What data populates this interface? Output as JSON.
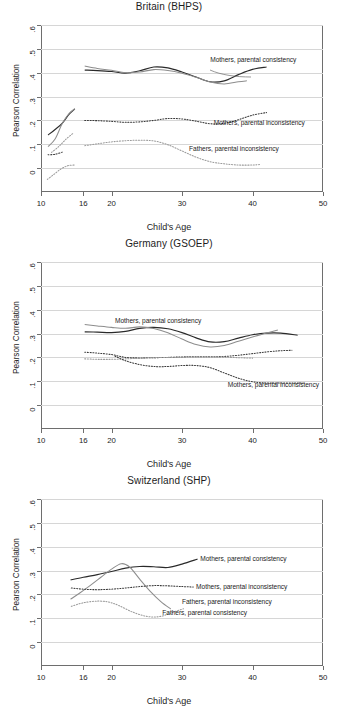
{
  "figure": {
    "width": 338,
    "height": 711,
    "background": "#ffffff",
    "axis_color": "#6e6e6e",
    "grid_color": "#d6d6d6"
  },
  "shared": {
    "xlabel": "Child's Age",
    "ylabel": "Pearson Correlation",
    "xticks": [
      10,
      16,
      20,
      30,
      40,
      50
    ],
    "xtick_labels": [
      "10",
      "16",
      "20",
      "30",
      "40",
      "50"
    ],
    "yticks": [
      0,
      0.1,
      0.2,
      0.3,
      0.4,
      0.5,
      0.6
    ],
    "ytick_labels": [
      "0",
      ".1",
      ".2",
      ".3",
      ".4",
      ".5",
      ".6"
    ],
    "xlim": [
      10,
      50
    ],
    "ylim": [
      -0.1,
      0.6
    ],
    "grid": "horizontal"
  },
  "chart_data": [
    {
      "type": "line",
      "title": "Britain (BHPS)",
      "xlabel": "Child's Age",
      "ylabel": "Pearson Correlation",
      "xlim": [
        10,
        50
      ],
      "ylim": [
        -0.1,
        0.6
      ],
      "xticks": [
        10,
        16,
        20,
        30,
        40,
        50
      ],
      "yticks": [
        0,
        0.1,
        0.2,
        0.3,
        0.4,
        0.5,
        0.6
      ],
      "grid": "horizontal",
      "legend_position": "inline-annotations",
      "annotations": [
        {
          "text": "Mothers, parental consistency",
          "x": 34.0,
          "y": 0.452
        },
        {
          "text": "Mothers, parental inconsistency",
          "x": 34.5,
          "y": 0.19
        },
        {
          "text": "Fathers, parental inconsistency",
          "x": 31.0,
          "y": 0.082
        }
      ],
      "series": [
        {
          "name": "Mothers, parental consistency (sample A)",
          "style": "solid-dark",
          "x": [
            16.2,
            18,
            20,
            22,
            24,
            26,
            28,
            30,
            32,
            34,
            36,
            38,
            40,
            42
          ],
          "y": [
            0.411,
            0.409,
            0.405,
            0.398,
            0.408,
            0.424,
            0.42,
            0.403,
            0.382,
            0.362,
            0.366,
            0.392,
            0.414,
            0.424
          ]
        },
        {
          "name": "Mothers, parental consistency (sample B)",
          "style": "solid-grey",
          "x": [
            16.2,
            18,
            20,
            22,
            24,
            26,
            28,
            30,
            32,
            34,
            36,
            38,
            39.2
          ],
          "y": [
            0.428,
            0.418,
            0.41,
            0.4,
            0.403,
            0.413,
            0.409,
            0.398,
            0.381,
            0.361,
            0.353,
            0.362,
            0.366
          ]
        },
        {
          "name": "Mothers, parental consistency (early adolescence, dark)",
          "style": "solid-dark",
          "x": [
            11.0,
            12.0,
            13.0,
            14.0,
            14.8
          ],
          "y": [
            0.139,
            0.162,
            0.188,
            0.226,
            0.248
          ]
        },
        {
          "name": "Mothers, parental consistency (early adolescence, grey)",
          "style": "solid-grey",
          "x": [
            11.0,
            12.0,
            13.0,
            14.0,
            14.8
          ],
          "y": [
            0.09,
            0.122,
            0.186,
            0.23,
            0.249
          ]
        },
        {
          "name": "Mothers, parental inconsistency",
          "style": "dot-dark",
          "x": [
            16.2,
            18,
            20,
            22,
            24,
            26,
            28,
            30,
            32,
            34,
            36,
            38,
            40,
            42
          ],
          "y": [
            0.2,
            0.199,
            0.196,
            0.192,
            0.194,
            0.2,
            0.208,
            0.206,
            0.197,
            0.186,
            0.188,
            0.203,
            0.222,
            0.233
          ]
        },
        {
          "name": "Mothers, parental inconsistency (early adolescence)",
          "style": "dot-dark",
          "x": [
            11.0,
            12.0,
            13.0
          ],
          "y": [
            0.056,
            0.058,
            0.067
          ]
        },
        {
          "name": "Fathers, parental inconsistency",
          "style": "dot-grey",
          "x": [
            16.2,
            18,
            20,
            22,
            24,
            26,
            28,
            30,
            32,
            34,
            36,
            38,
            40,
            41
          ],
          "y": [
            0.094,
            0.102,
            0.11,
            0.115,
            0.117,
            0.114,
            0.098,
            0.072,
            0.046,
            0.027,
            0.018,
            0.013,
            0.013,
            0.015
          ]
        },
        {
          "name": "Fathers, parental inconsistency (early adolescence)",
          "style": "dot-grey",
          "x": [
            11.5,
            12.5,
            13.5,
            14.6
          ],
          "y": [
            0.066,
            0.09,
            0.12,
            0.147
          ]
        },
        {
          "name": "Fathers, parental consistency (early adolescence)",
          "style": "dot-grey",
          "x": [
            10.9,
            11.8,
            12.8,
            13.8,
            14.8
          ],
          "y": [
            -0.047,
            -0.027,
            -0.004,
            0.01,
            0.013
          ]
        }
      ]
    },
    {
      "type": "line",
      "title": "Germany (GSOEP)",
      "xlabel": "Child's Age",
      "ylabel": "Pearson Correlation",
      "xlim": [
        10,
        50
      ],
      "ylim": [
        -0.1,
        0.6
      ],
      "xticks": [
        10,
        16,
        20,
        30,
        40,
        50
      ],
      "yticks": [
        0,
        0.1,
        0.2,
        0.3,
        0.4,
        0.5,
        0.6
      ],
      "grid": "horizontal",
      "legend_position": "inline-annotations",
      "annotations": [
        {
          "text": "Mothers, parental consistency",
          "x": 20.5,
          "y": 0.352
        },
        {
          "text": "Mothers, parental inconsistency",
          "x": 36.5,
          "y": 0.086
        }
      ],
      "series": [
        {
          "name": "Mothers, parental consistency (sample A)",
          "style": "solid-dark",
          "x": [
            16.2,
            18,
            20,
            22,
            24,
            26,
            28,
            30,
            32,
            34,
            36,
            38,
            40,
            42,
            44,
            46.4
          ],
          "y": [
            0.307,
            0.306,
            0.304,
            0.309,
            0.322,
            0.326,
            0.32,
            0.304,
            0.282,
            0.265,
            0.266,
            0.281,
            0.295,
            0.302,
            0.302,
            0.293
          ]
        },
        {
          "name": "Mothers, parental consistency (sample B)",
          "style": "solid-grey",
          "x": [
            16.2,
            18,
            20,
            22,
            24,
            26,
            28,
            30,
            32,
            34,
            36,
            38,
            40,
            42,
            43.6
          ],
          "y": [
            0.338,
            0.332,
            0.326,
            0.322,
            0.328,
            0.321,
            0.303,
            0.277,
            0.254,
            0.244,
            0.25,
            0.268,
            0.286,
            0.302,
            0.315
          ]
        },
        {
          "name": "Mothers, parental inconsistency (upper)",
          "style": "dot-dark",
          "x": [
            16.2,
            18,
            20,
            22,
            24,
            26,
            28,
            30,
            32,
            34,
            36,
            38,
            40,
            42,
            44,
            45.6
          ],
          "y": [
            0.222,
            0.218,
            0.212,
            0.2,
            0.198,
            0.199,
            0.2,
            0.202,
            0.203,
            0.203,
            0.204,
            0.209,
            0.216,
            0.223,
            0.228,
            0.23
          ]
        },
        {
          "name": "Fathers, parental inconsistency (upper-flat)",
          "style": "dot-grey",
          "x": [
            16.2,
            18,
            20,
            22,
            24,
            26,
            28,
            30,
            32,
            34,
            36,
            38,
            40
          ],
          "y": [
            0.194,
            0.192,
            0.192,
            0.194,
            0.197,
            0.199,
            0.2,
            0.201,
            0.202,
            0.202,
            0.201,
            0.199,
            0.197
          ]
        },
        {
          "name": "Mothers, parental inconsistency (declining)",
          "style": "dot-dark",
          "x": [
            20.5,
            22,
            24,
            26,
            28,
            30,
            32,
            34,
            36,
            38,
            40,
            42,
            44,
            46,
            47.2
          ],
          "y": [
            0.205,
            0.186,
            0.17,
            0.162,
            0.162,
            0.166,
            0.166,
            0.157,
            0.135,
            0.113,
            0.098,
            0.093,
            0.093,
            0.093,
            0.093
          ]
        }
      ]
    },
    {
      "type": "line",
      "title": "Switzerland (SHP)",
      "xlabel": "Child's Age",
      "ylabel": "Pearson Correlation",
      "xlim": [
        10,
        50
      ],
      "ylim": [
        -0.1,
        0.6
      ],
      "xticks": [
        10,
        16,
        20,
        30,
        40,
        50
      ],
      "yticks": [
        0,
        0.1,
        0.2,
        0.3,
        0.4,
        0.5,
        0.6
      ],
      "grid": "horizontal",
      "legend_position": "inline-annotations",
      "annotations": [
        {
          "text": "Mothers, parental consistency",
          "x": 32.6,
          "y": 0.347
        },
        {
          "text": "Mothers, parental inconsistency",
          "x": 32.0,
          "y": 0.232
        },
        {
          "text": "Fathers, parental inconsistency",
          "x": 30.0,
          "y": 0.168
        },
        {
          "text": "Fathers, parental consistency",
          "x": 27.2,
          "y": 0.122
        }
      ],
      "series": [
        {
          "name": "Mothers, parental consistency",
          "style": "solid-dark",
          "x": [
            14.2,
            16,
            18,
            20,
            22,
            24,
            26,
            28,
            30,
            32.2
          ],
          "y": [
            0.261,
            0.272,
            0.283,
            0.296,
            0.31,
            0.317,
            0.316,
            0.313,
            0.327,
            0.348
          ]
        },
        {
          "name": "Fathers, parental consistency",
          "style": "solid-grey",
          "x": [
            14.2,
            15.5,
            17,
            18.5,
            20,
            21.4,
            22.6,
            24,
            25.5,
            27,
            28.4
          ],
          "y": [
            0.18,
            0.206,
            0.238,
            0.272,
            0.306,
            0.329,
            0.314,
            0.264,
            0.213,
            0.17,
            0.139
          ]
        },
        {
          "name": "Mothers, parental inconsistency",
          "style": "dot-dark",
          "x": [
            14.3,
            16,
            18,
            20,
            22,
            24,
            26,
            28,
            30,
            31.6
          ],
          "y": [
            0.227,
            0.222,
            0.22,
            0.222,
            0.227,
            0.233,
            0.237,
            0.236,
            0.233,
            0.231
          ]
        },
        {
          "name": "Fathers, parental inconsistency",
          "style": "dot-grey",
          "x": [
            14.3,
            16,
            18,
            19.6,
            21,
            23,
            25,
            26.8,
            28.4,
            30.2
          ],
          "y": [
            0.15,
            0.165,
            0.172,
            0.168,
            0.154,
            0.126,
            0.108,
            0.107,
            0.122,
            0.14
          ]
        }
      ]
    }
  ]
}
